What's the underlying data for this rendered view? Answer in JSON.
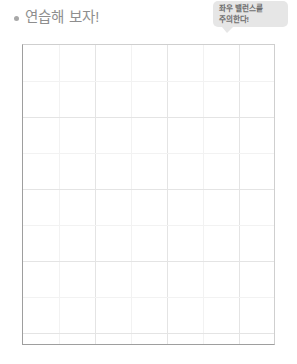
{
  "page": {
    "background_color": "#ffffff",
    "width": 297,
    "height": 364
  },
  "header": {
    "bullet_icon": "bullet-dot-icon",
    "title": "연습해 보자!",
    "title_color": "#8e8e8e"
  },
  "callout": {
    "icon": "speech-bubble-icon",
    "background_color": "#e6e6e6",
    "text_color": "#6f6f6f",
    "lines": [
      "좌우 밸런스를",
      "주의한다!"
    ]
  },
  "practice_grid": {
    "label": "practice-grid",
    "border_color": "#9e9e9e",
    "grid_line_color": "#e4e4e4",
    "minor_grid_line_color": "#f2f2f2",
    "columns": 7,
    "rows": 8,
    "cell_size_px": 36,
    "content": ""
  }
}
